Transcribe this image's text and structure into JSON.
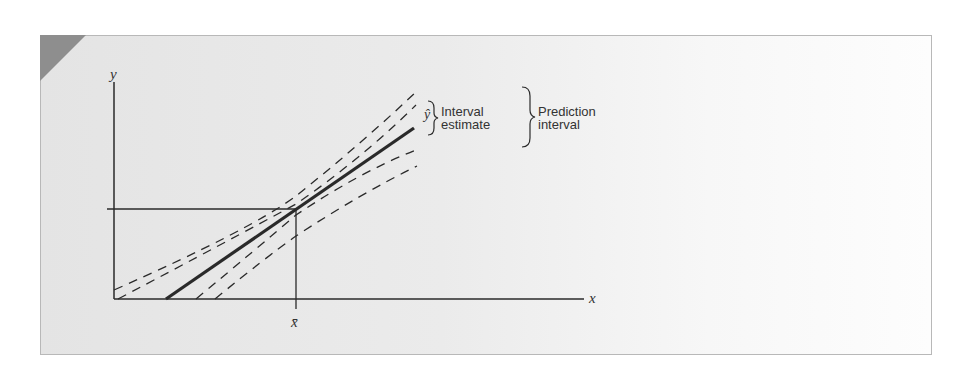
{
  "figure": {
    "axis_y_label": "y",
    "axis_x_label": "x",
    "x_mean_label": "x̄",
    "y_hat_label": "ŷ",
    "interval_estimate_label_line1": "Interval",
    "interval_estimate_label_line2": "estimate",
    "prediction_interval_label_line1": "Prediction",
    "prediction_interval_label_line2": "interval"
  },
  "colors": {
    "panel_background": "#e9e9e9",
    "corner_tab": "#8e8e8e",
    "line": "#2a2a2a",
    "text": "#333333"
  },
  "elements": {
    "regression_line": "solid thick line (ŷ)",
    "confidence_bands": "inner dashed curves (interval estimate for mean)",
    "prediction_bands": "outer dashed curves (prediction interval)",
    "mean_reference_lines": "horizontal and vertical lines meeting at (x̄, ȳ)"
  }
}
